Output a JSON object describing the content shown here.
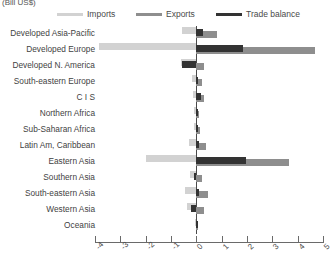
{
  "axis_unit_label": "(Bill US$)",
  "legend": {
    "position": "top",
    "items": [
      {
        "label": "Imports",
        "color": "#d2d2d2",
        "icon": "line-swatch-icon"
      },
      {
        "label": "Exports",
        "color": "#8e8e8e",
        "icon": "line-swatch-icon"
      },
      {
        "label": "Trade balance",
        "color": "#333333",
        "icon": "line-swatch-icon"
      }
    ]
  },
  "chart_data": {
    "type": "bar",
    "orientation": "horizontal",
    "title": "",
    "subtitle": "",
    "xlabel": "(Bill US$)",
    "ylabel": "",
    "xlim": [
      -4,
      5
    ],
    "grid": false,
    "legend_position": "top",
    "xticks": [
      -4,
      -3,
      -2,
      -1,
      0,
      1,
      2,
      3,
      4,
      5
    ],
    "xtick_labels": [
      "-4",
      "-3",
      "-2",
      "-1",
      "0",
      "1",
      "2",
      "3",
      "4",
      "5"
    ],
    "categories": [
      "Developed Asia-Pacific",
      "Developed Europe",
      "Developed N. America",
      "South-eastern Europe",
      "C I S",
      "Northern Africa",
      "Sub-Saharan Africa",
      "Latin Am, Caribbean",
      "Eastern Asia",
      "Southern Asia",
      "South-eastern Asia",
      "Western Asia",
      "Oceania"
    ],
    "series": [
      {
        "name": "Imports",
        "color": "#d2d2d2",
        "values": [
          -0.55,
          -3.85,
          -0.62,
          -0.18,
          -0.12,
          -0.1,
          -0.1,
          -0.3,
          -2.0,
          -0.25,
          -0.45,
          -0.38,
          -0.05
        ]
      },
      {
        "name": "Exports",
        "color": "#8e8e8e",
        "values": [
          0.8,
          4.7,
          0.3,
          0.22,
          0.3,
          0.12,
          0.14,
          0.38,
          3.65,
          0.22,
          0.48,
          0.3,
          0.06
        ]
      },
      {
        "name": "Trade balance",
        "color": "#333333",
        "values": [
          0.25,
          1.85,
          -0.55,
          0.08,
          0.2,
          0.04,
          0.05,
          0.1,
          1.95,
          -0.08,
          0.1,
          -0.2,
          0.02
        ]
      }
    ]
  }
}
